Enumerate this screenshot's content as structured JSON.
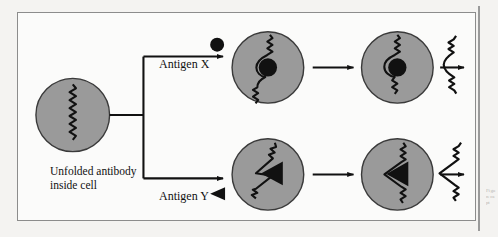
{
  "figure": {
    "background_color": "#f4f3f1",
    "panel_color": "#fbfbfa",
    "border_color": "#8c8c8c",
    "cell_fill": "#9a9a9a",
    "cell_stroke": "#3a3a3a",
    "ink_color": "#111111"
  },
  "labels": {
    "unfolded_line1": "Unfolded antibody",
    "unfolded_line2": "inside cell",
    "unfolded_full": "Unfolded antibody inside cell",
    "antigen_x": "Antigen X",
    "antigen_y": "Antigen Y"
  },
  "margin": {
    "note": "Fi gu re ca pt"
  },
  "nodes": [
    {
      "id": "start-cell",
      "name": "unfolded-antibody-cell",
      "shape": "circle",
      "contents": "vertical-squiggle",
      "antigen": "none",
      "row": "start"
    },
    {
      "id": "x-cell-1",
      "name": "antigen-x-bound-cell-1",
      "shape": "circle",
      "contents": "squiggle-around-circle",
      "antigen": "circle",
      "row": "top"
    },
    {
      "id": "x-cell-2",
      "name": "antigen-x-bound-cell-2",
      "shape": "circle",
      "contents": "squiggle-folded-circle",
      "antigen": "circle",
      "row": "top"
    },
    {
      "id": "x-free",
      "name": "folded-antibody-x",
      "shape": "free-squiggle",
      "contents": "s-curve",
      "antigen": "none",
      "row": "top"
    },
    {
      "id": "y-cell-1",
      "name": "antigen-y-bound-cell-1",
      "shape": "circle",
      "contents": "squiggle-around-triangle",
      "antigen": "triangle",
      "row": "bottom"
    },
    {
      "id": "y-cell-2",
      "name": "antigen-y-bound-cell-2",
      "shape": "circle",
      "contents": "squiggle-folded-triangle",
      "antigen": "triangle",
      "row": "bottom"
    },
    {
      "id": "y-free",
      "name": "folded-antibody-y",
      "shape": "free-squiggle",
      "contents": "v-curve",
      "antigen": "none",
      "row": "bottom"
    }
  ],
  "arrows": [
    {
      "from": "start-cell",
      "to": "branch",
      "type": "branch-stem"
    },
    {
      "from": "branch",
      "to": "x-cell-1",
      "type": "arrow",
      "label": "Antigen X"
    },
    {
      "from": "branch",
      "to": "y-cell-1",
      "type": "arrow",
      "label": "Antigen Y"
    },
    {
      "from": "x-cell-1",
      "to": "x-cell-2",
      "type": "arrow",
      "label": ""
    },
    {
      "from": "x-cell-2",
      "to": "x-free",
      "type": "arrow",
      "label": ""
    },
    {
      "from": "y-cell-1",
      "to": "y-cell-2",
      "type": "arrow",
      "label": ""
    },
    {
      "from": "y-cell-2",
      "to": "y-free",
      "type": "arrow",
      "label": ""
    }
  ],
  "icons": {
    "antigen_x_glyph": "filled-circle",
    "antigen_y_glyph": "filled-left-triangle"
  }
}
